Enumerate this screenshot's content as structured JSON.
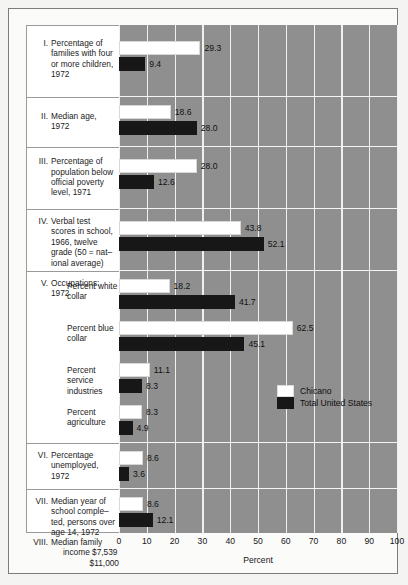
{
  "chart_data": {
    "type": "bar",
    "orientation": "horizontal",
    "title": "",
    "xlabel": "Percent",
    "ylabel": "",
    "xlim": [
      0,
      100
    ],
    "xticks": [
      0,
      10,
      20,
      30,
      40,
      50,
      60,
      70,
      80,
      90,
      100
    ],
    "grid": true,
    "legend_position": "inside-right-middle",
    "series": [
      {
        "name": "Chicano",
        "color": "#ffffff"
      },
      {
        "name": "Total United States",
        "color": "#171717"
      }
    ],
    "categories": [
      "I. Percentage of families with four or more children, 1972",
      "II. Median age, 1972",
      "III. Percentage of population below official poverty level, 1971",
      "IV. Verbal test scores in school, 1966, twelve grade (50 = national average)",
      "V. Occupations: 1972 — Percent white collar",
      "V. Occupations: 1972 — Percent blue collar",
      "V. Occupations: 1972 — Percent service industries",
      "V. Occupations: 1972 — Percent agriculture",
      "VI. Percentage unemployed, 1972",
      "VII. Median year of school completed, persons over age 14, 1972"
    ],
    "values": {
      "Chicano": [
        29.3,
        18.6,
        28.0,
        43.8,
        18.2,
        62.5,
        11.1,
        8.3,
        8.6,
        8.6
      ],
      "Total United States": [
        9.4,
        28.0,
        12.6,
        52.1,
        41.7,
        45.1,
        8.3,
        4.9,
        3.6,
        12.1
      ]
    },
    "note_row": {
      "number": "VIII.",
      "label_line1": "Median family",
      "label_line2": "income $7,539",
      "label_line3": "$11,000",
      "chicano_value": "$7,539",
      "total_us_value": "$11,000"
    }
  },
  "sections": [
    {
      "number": "I.",
      "lines": [
        "Percentage of",
        "families with four",
        "or more children,",
        "1972"
      ],
      "rows": [
        {
          "series": "Chicano",
          "value": 29.3,
          "label": "29.3"
        },
        {
          "series": "Total United States",
          "value": 9.4,
          "label": "9.4"
        }
      ]
    },
    {
      "number": "II.",
      "lines": [
        "Median age,",
        "1972"
      ],
      "rows": [
        {
          "series": "Chicano",
          "value": 18.6,
          "label": "18.6"
        },
        {
          "series": "Total United States",
          "value": 28.0,
          "label": "28.0"
        }
      ]
    },
    {
      "number": "III.",
      "lines": [
        "Percentage of",
        "population below",
        "official poverty",
        "level, 1971"
      ],
      "rows": [
        {
          "series": "Chicano",
          "value": 28.0,
          "label": "28.0"
        },
        {
          "series": "Total United States",
          "value": 12.6,
          "label": "12.6"
        }
      ]
    },
    {
      "number": "IV.",
      "lines": [
        "Verbal test",
        "scores in school,",
        "1966, twelve",
        "grade (50 = nat–",
        "ional average)"
      ],
      "rows": [
        {
          "series": "Chicano",
          "value": 43.8,
          "label": "43.8"
        },
        {
          "series": "Total United States",
          "value": 52.1,
          "label": "52.1"
        }
      ]
    },
    {
      "number": "V.",
      "lines": [
        "Occupations:",
        "1972"
      ],
      "subgroups": [
        {
          "lines": [
            "Percent white",
            "collar"
          ],
          "rows": [
            {
              "series": "Chicano",
              "value": 18.2,
              "label": "18.2"
            },
            {
              "series": "Total United States",
              "value": 41.7,
              "label": "41.7"
            }
          ]
        },
        {
          "lines": [
            "Percent blue",
            "collar"
          ],
          "rows": [
            {
              "series": "Chicano",
              "value": 62.5,
              "label": "62.5"
            },
            {
              "series": "Total United States",
              "value": 45.1,
              "label": "45.1"
            }
          ]
        },
        {
          "lines": [
            "Percent service",
            "industries"
          ],
          "rows": [
            {
              "series": "Chicano",
              "value": 11.1,
              "label": "11.1"
            },
            {
              "series": "Total United States",
              "value": 8.3,
              "label": "8.3"
            }
          ]
        },
        {
          "lines": [
            "Percent",
            "agriculture"
          ],
          "rows": [
            {
              "series": "Chicano",
              "value": 8.3,
              "label": "8.3"
            },
            {
              "series": "Total United States",
              "value": 4.9,
              "label": "4.9"
            }
          ]
        }
      ]
    },
    {
      "number": "VI.",
      "lines": [
        "Percentage",
        "unemployed,",
        "1972"
      ],
      "rows": [
        {
          "series": "Chicano",
          "value": 8.6,
          "label": "8.6"
        },
        {
          "series": "Total United States",
          "value": 3.6,
          "label": "3.6"
        }
      ]
    },
    {
      "number": "VII.",
      "lines": [
        "Median year of",
        "school comple–",
        "ted, persons over",
        "age 14, 1972"
      ],
      "rows": [
        {
          "series": "Chicano",
          "value": 8.6,
          "label": "8.6"
        },
        {
          "series": "Total United States",
          "value": 12.1,
          "label": "12.1"
        }
      ]
    }
  ],
  "legend": {
    "items": [
      {
        "label": "Chicano",
        "color": "#ffffff"
      },
      {
        "label": "Total United States",
        "color": "#171717"
      }
    ]
  },
  "axis": {
    "ticks": [
      "0",
      "10",
      "20",
      "30",
      "40",
      "50",
      "60",
      "70",
      "80",
      "90",
      "100"
    ],
    "title": "Percent"
  },
  "colors": {
    "plot_background": "#8f8f8f",
    "gridline": "#f0f0ee",
    "chicano": "#ffffff",
    "total_us": "#171717",
    "frame": "#7c7c7c",
    "page": "#f4f4f2"
  }
}
